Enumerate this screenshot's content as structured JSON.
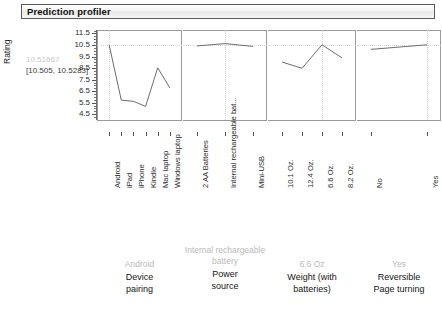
{
  "window": {
    "title": "Prediction profiler"
  },
  "axis": {
    "y_title": "Rating",
    "prediction_value": "10.51667",
    "prediction_ci": "[10.505, 10.5283]",
    "y_ticks": [
      "11.5",
      "10.5",
      "9.5",
      "8.5",
      "7.5",
      "6.5",
      "5.5",
      "4.5"
    ]
  },
  "chart_data": {
    "type": "line",
    "title": "Prediction profiler",
    "ylabel": "Rating",
    "xlabel": "",
    "ylim": [
      4.0,
      11.8
    ],
    "grid": true,
    "legend": "none",
    "reference_line_y": 10.5,
    "prediction": 10.51667,
    "prediction_interval": [
      10.505,
      10.5283
    ],
    "panels": [
      {
        "factor": "Device pairing",
        "current_setting": "Android",
        "categories": [
          "Android",
          "iPad",
          "iPhone",
          "Kindle",
          "Mac laptop",
          "Windows laptop"
        ],
        "values": [
          10.52,
          5.72,
          5.62,
          5.18,
          8.52,
          6.78
        ]
      },
      {
        "factor": "Power source",
        "current_setting": "Internal rechargeable battery",
        "categories": [
          "2 AA Batteries",
          "Internal rechargeable bat...",
          "Mini-USB"
        ],
        "values": [
          10.42,
          10.62,
          10.38
        ]
      },
      {
        "factor": "Weight (with batteries)",
        "current_setting": "6.6 Oz.",
        "categories": [
          "10.1 Oz.",
          "12.4 Oz.",
          "6.6 Oz.",
          "8.2 Oz."
        ],
        "values": [
          9.02,
          8.48,
          10.52,
          9.38
        ]
      },
      {
        "factor": "Reversible Page turning",
        "current_setting": "Yes",
        "categories": [
          "No",
          "Yes"
        ],
        "values": [
          10.12,
          10.52
        ]
      }
    ]
  },
  "footer": {
    "blocks": [
      {
        "current": "Android",
        "name": "Device\npairing"
      },
      {
        "current": "Internal rechargeable\nbattery",
        "name": "Power\nsource"
      },
      {
        "current": "6.6 Oz",
        "name": "Weight (with\nbatteries)"
      },
      {
        "current": "Yes",
        "name": "Reversible\nPage turning"
      }
    ],
    "vertical_note": "Internal"
  }
}
